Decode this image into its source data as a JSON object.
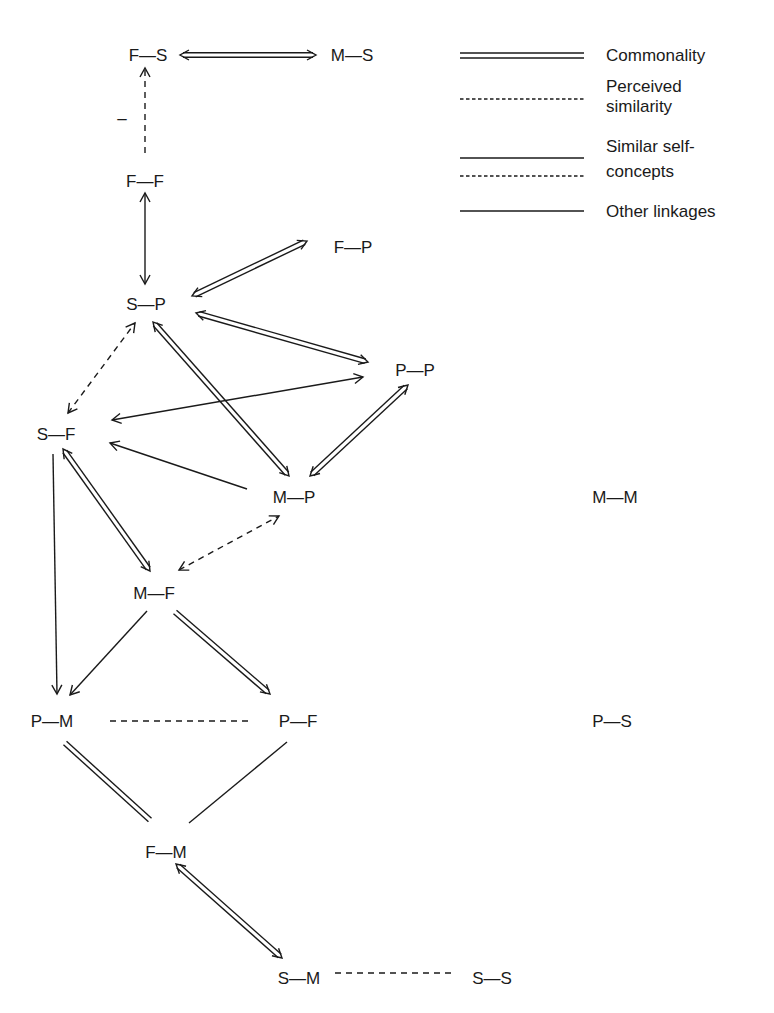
{
  "diagram": {
    "nodes": [
      {
        "id": "FS",
        "label": "F—S",
        "x": 148,
        "y": 55
      },
      {
        "id": "MS",
        "label": "M—S",
        "x": 352,
        "y": 55
      },
      {
        "id": "FF",
        "label": "F—F",
        "x": 145,
        "y": 181
      },
      {
        "id": "FP",
        "label": "F—P",
        "x": 353,
        "y": 247
      },
      {
        "id": "SP",
        "label": "S—P",
        "x": 146,
        "y": 304
      },
      {
        "id": "PP",
        "label": "P—P",
        "x": 415,
        "y": 370
      },
      {
        "id": "SF",
        "label": "S—F",
        "x": 56,
        "y": 434
      },
      {
        "id": "MP",
        "label": "M—P",
        "x": 294,
        "y": 497
      },
      {
        "id": "MM",
        "label": "M—M",
        "x": 615,
        "y": 497
      },
      {
        "id": "MF",
        "label": "M—F",
        "x": 154,
        "y": 593
      },
      {
        "id": "PM",
        "label": "P—M",
        "x": 52,
        "y": 721
      },
      {
        "id": "PF",
        "label": "P—F",
        "x": 298,
        "y": 721
      },
      {
        "id": "PS",
        "label": "P—S",
        "x": 612,
        "y": 721
      },
      {
        "id": "FM",
        "label": "F—M",
        "x": 166,
        "y": 852
      },
      {
        "id": "SM",
        "label": "S—M",
        "x": 299,
        "y": 978
      },
      {
        "id": "SS",
        "label": "S—S",
        "x": 492,
        "y": 978
      }
    ],
    "edges": [
      {
        "from": "FS",
        "to": "MS",
        "type": "commonality",
        "arrows": "both",
        "x1": 180,
        "y1": 55,
        "x2": 316,
        "y2": 55
      },
      {
        "from": "FF",
        "to": "FS",
        "type": "perceived_similarity",
        "arrows": "end",
        "x1": 145,
        "y1": 153,
        "x2": 145,
        "y2": 68
      },
      {
        "from": "FF",
        "to": "SP",
        "type": "other",
        "arrows": "both",
        "x1": 145,
        "y1": 193,
        "x2": 145,
        "y2": 284
      },
      {
        "from": "SP",
        "to": "FP",
        "type": "commonality",
        "arrows": "both",
        "x1": 192,
        "y1": 296,
        "x2": 307,
        "y2": 241
      },
      {
        "from": "SP",
        "to": "PP",
        "type": "commonality",
        "arrows": "both",
        "x1": 196,
        "y1": 313,
        "x2": 368,
        "y2": 362
      },
      {
        "from": "SP",
        "to": "MP",
        "type": "commonality",
        "arrows": "both",
        "x1": 153,
        "y1": 322,
        "x2": 289,
        "y2": 476
      },
      {
        "from": "SF",
        "to": "SP",
        "type": "perceived_similarity",
        "arrows": "both",
        "x1": 68,
        "y1": 413,
        "x2": 135,
        "y2": 323
      },
      {
        "from": "SF",
        "to": "PP",
        "type": "other",
        "arrows": "both",
        "x1": 112,
        "y1": 420,
        "x2": 363,
        "y2": 377
      },
      {
        "from": "MP",
        "to": "PP",
        "type": "commonality",
        "arrows": "both",
        "x1": 310,
        "y1": 476,
        "x2": 408,
        "y2": 385
      },
      {
        "from": "MP",
        "to": "SF",
        "type": "other",
        "arrows": "end",
        "x1": 247,
        "y1": 489,
        "x2": 110,
        "y2": 443
      },
      {
        "from": "SF",
        "to": "MF",
        "type": "commonality",
        "arrows": "both",
        "x1": 63,
        "y1": 449,
        "x2": 150,
        "y2": 571
      },
      {
        "from": "MF",
        "to": "MP",
        "type": "perceived_similarity",
        "arrows": "both",
        "x1": 179,
        "y1": 570,
        "x2": 279,
        "y2": 516
      },
      {
        "from": "SF",
        "to": "PM",
        "type": "other",
        "arrows": "end",
        "x1": 53,
        "y1": 454,
        "x2": 57,
        "y2": 694
      },
      {
        "from": "MF",
        "to": "PM",
        "type": "other",
        "arrows": "end",
        "x1": 147,
        "y1": 611,
        "x2": 70,
        "y2": 695
      },
      {
        "from": "MF",
        "to": "PF",
        "type": "commonality",
        "arrows": "end",
        "x1": 175,
        "y1": 612,
        "x2": 270,
        "y2": 694
      },
      {
        "from": "PM",
        "to": "PF",
        "type": "perceived_similarity",
        "arrows": "none",
        "x1": 110,
        "y1": 721,
        "x2": 252,
        "y2": 721
      },
      {
        "from": "PM",
        "to": "FM",
        "type": "commonality",
        "arrows": "none",
        "x1": 65,
        "y1": 743,
        "x2": 150,
        "y2": 820
      },
      {
        "from": "PF",
        "to": "FM",
        "type": "other",
        "arrows": "none",
        "x1": 287,
        "y1": 742,
        "x2": 189,
        "y2": 823
      },
      {
        "from": "FM",
        "to": "SM",
        "type": "commonality",
        "arrows": "both",
        "x1": 176,
        "y1": 864,
        "x2": 282,
        "y2": 958
      },
      {
        "from": "SM",
        "to": "SS",
        "type": "perceived_similarity",
        "arrows": "none",
        "x1": 335,
        "y1": 973,
        "x2": 452,
        "y2": 973
      }
    ],
    "annotations": [
      {
        "text": "–",
        "x": 122,
        "y": 118
      }
    ]
  },
  "legend": {
    "items": [
      {
        "type": "commonality",
        "label_lines": [
          "Commonality"
        ],
        "y": 22
      },
      {
        "type": "perceived_similarity",
        "label_lines": [
          "Perceived",
          "similarity"
        ],
        "y": 66
      },
      {
        "type": "similar_self_concepts",
        "label_lines": [
          "Similar self-",
          "concepts"
        ],
        "y": 158
      },
      {
        "type": "other",
        "label_lines": [
          "Other linkages"
        ],
        "y": 212
      }
    ]
  },
  "colors": {
    "ink": "#1a1a1a",
    "background": "#ffffff"
  }
}
